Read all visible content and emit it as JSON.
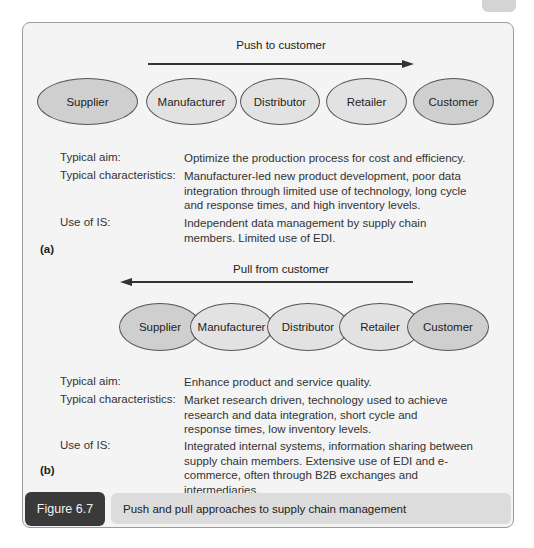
{
  "figure": {
    "number": "Figure 6.7",
    "caption": "Push and pull approaches to supply chain management"
  },
  "panel_a": {
    "part_label": "(a)",
    "arrow_label": "Push to customer",
    "arrow_direction": "right",
    "nodes": [
      "Supplier",
      "Manufacturer",
      "Distributor",
      "Retailer",
      "Customer"
    ],
    "rows": [
      {
        "label": "Typical aim:",
        "value": "Optimize the production process for cost and efficiency."
      },
      {
        "label": "Typical characteristics:",
        "value": "Manufacturer-led new product development, poor data integration through limited use of technology, long cycle and response times, and high inventory levels."
      },
      {
        "label": "Use of IS:",
        "value": "Independent data management by supply chain members. Limited use of EDI."
      }
    ]
  },
  "panel_b": {
    "part_label": "(b)",
    "arrow_label": "Pull from customer",
    "arrow_direction": "left",
    "nodes": [
      "Supplier",
      "Manufacturer",
      "Distributor",
      "Retailer",
      "Customer"
    ],
    "rows": [
      {
        "label": "Typical aim:",
        "value": "Enhance product and service quality."
      },
      {
        "label": "Typical characteristics:",
        "value": "Market research driven, technology used to achieve research and data integration, short cycle and response times, low inventory levels."
      },
      {
        "label": "Use of IS:",
        "value": "Integrated internal systems, information sharing between supply chain members. Extensive use of EDI and e-commerce, often through B2B exchanges and intermediaries."
      }
    ]
  },
  "colors": {
    "box_background": "#f4f4f4",
    "oval_dark": "#cfcfcf",
    "oval_light": "#e2e2e2",
    "caption_number_bg": "#3a3a3a",
    "caption_text_bg": "#dcdcdc"
  }
}
